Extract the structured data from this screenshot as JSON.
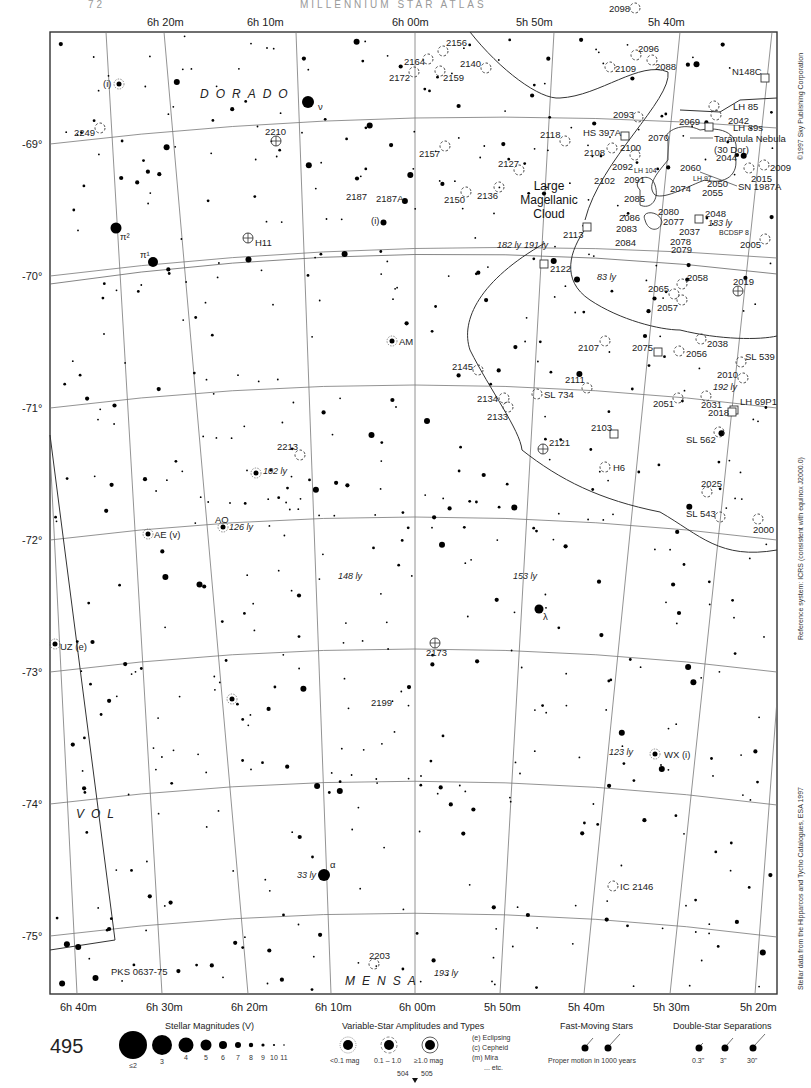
{
  "page": {
    "header_left": "72",
    "header_center": "MILLENNIUM STAR ATLAS",
    "page_number": "495",
    "adjacent_pages": {
      "left": "504",
      "right": "505"
    }
  },
  "side_text": {
    "copyright": "©1997 Sky Publishing Corporation",
    "reference": "Reference system: ICRS (consistent with equinox J2000.0)",
    "source": "Stellar data from the Hipparcos and Tycho Catalogues, ESA 1997"
  },
  "axes": {
    "ra_top": [
      "6h 20m",
      "6h 10m",
      "6h 00m",
      "5h 50m",
      "5h 40m"
    ],
    "ra_bottom": [
      "6h 40m",
      "6h 30m",
      "6h 20m",
      "6h 10m",
      "6h 00m",
      "5h 50m",
      "5h 40m",
      "5h 30m",
      "5h 20m"
    ],
    "dec_left": [
      "-69°",
      "-70°",
      "-71°",
      "-72°",
      "-73°",
      "-74°",
      "-75°"
    ]
  },
  "constellations": [
    {
      "name": "DORADO",
      "x": 200,
      "y": 98
    },
    {
      "name": "VOL",
      "x": 76,
      "y": 818
    },
    {
      "name": "MENSA",
      "x": 345,
      "y": 985
    }
  ],
  "major_labels": {
    "lmc": [
      "Large",
      "Magellanic",
      "Cloud"
    ],
    "tarantula": [
      "Tarántula Nebula",
      "(30 Dor)"
    ],
    "sn": "SN 1987A"
  },
  "named_stars": [
    {
      "label": "ν",
      "x": 308,
      "y": 102,
      "r": 6,
      "lx": 318,
      "ly": 110
    },
    {
      "label": "π²",
      "x": 116,
      "y": 228,
      "r": 5.5,
      "lx": 120,
      "ly": 240
    },
    {
      "label": "π¹",
      "x": 153,
      "y": 262,
      "r": 5,
      "lx": 140,
      "ly": 258
    },
    {
      "label": "α",
      "x": 324,
      "y": 875,
      "r": 6,
      "lx": 330,
      "ly": 868
    },
    {
      "label": "λ",
      "x": 539,
      "y": 609,
      "r": 4.5,
      "lx": 543,
      "ly": 620
    }
  ],
  "variable_stars": [
    {
      "label": "(i)",
      "x": 119,
      "y": 84,
      "lx": 103,
      "ly": 87
    },
    {
      "label": "AM",
      "x": 392,
      "y": 341,
      "lx": 399,
      "ly": 345
    },
    {
      "label": "AE (v)",
      "x": 148,
      "y": 534,
      "lx": 154,
      "ly": 538
    },
    {
      "label": "AO",
      "x": 223,
      "y": 527,
      "lx": 215,
      "ly": 523
    },
    {
      "label": "UZ (e)",
      "x": 55,
      "y": 644,
      "lx": 60,
      "ly": 650
    },
    {
      "label": "WX (i)",
      "x": 655,
      "y": 754,
      "lx": 664,
      "ly": 758
    },
    {
      "label": "",
      "x": 232,
      "y": 699,
      "lx": 0,
      "ly": 0
    },
    {
      "label": "",
      "x": 256,
      "y": 473,
      "lx": 0,
      "ly": 0
    }
  ],
  "distance_labels": [
    {
      "text": "182 ly",
      "x": 497,
      "y": 248
    },
    {
      "text": "191 ly",
      "x": 524,
      "y": 248
    },
    {
      "text": "83 ly",
      "x": 597,
      "y": 280
    },
    {
      "text": "102 ly",
      "x": 263,
      "y": 474
    },
    {
      "text": "126 ly",
      "x": 229,
      "y": 530
    },
    {
      "text": "148 ly",
      "x": 338,
      "y": 579
    },
    {
      "text": "153 ly",
      "x": 513,
      "y": 579
    },
    {
      "text": "192 ly",
      "x": 713,
      "y": 390
    },
    {
      "text": "183 ly",
      "x": 708,
      "y": 226
    },
    {
      "text": "123 ly",
      "x": 609,
      "y": 755
    },
    {
      "text": "33 ly",
      "x": 297,
      "y": 878
    },
    {
      "text": "193 ly",
      "x": 434,
      "y": 976
    }
  ],
  "clusters": [
    {
      "id": "2249",
      "x": 100,
      "y": 128,
      "lx": 74,
      "ly": 136
    },
    {
      "id": "2156",
      "x": 443,
      "y": 51,
      "lx": 446,
      "ly": 46
    },
    {
      "id": "2164",
      "x": 428,
      "y": 59,
      "lx": 404,
      "ly": 65
    },
    {
      "id": "2172",
      "x": 414,
      "y": 72,
      "lx": 389,
      "ly": 81
    },
    {
      "id": "2159",
      "x": 440,
      "y": 71,
      "lx": 443,
      "ly": 81
    },
    {
      "id": "2140",
      "x": 486,
      "y": 68,
      "lx": 460,
      "ly": 67
    },
    {
      "id": "2157",
      "x": 445,
      "y": 146,
      "lx": 419,
      "ly": 157
    },
    {
      "id": "2127",
      "x": 519,
      "y": 170,
      "lx": 498,
      "ly": 167
    },
    {
      "id": "2136",
      "x": 499,
      "y": 187,
      "lx": 477,
      "ly": 199
    },
    {
      "id": "2118",
      "x": 565,
      "y": 141,
      "lx": 540,
      "ly": 138
    },
    {
      "id": "2098",
      "x": 635,
      "y": 8,
      "lx": 609,
      "ly": 12
    },
    {
      "id": "2096",
      "x": 636,
      "y": 55,
      "lx": 638,
      "ly": 52
    },
    {
      "id": "2088",
      "x": 652,
      "y": 60,
      "lx": 655,
      "ly": 70
    },
    {
      "id": "2109",
      "x": 610,
      "y": 67,
      "lx": 615,
      "ly": 72
    },
    {
      "id": "2093",
      "x": 638,
      "y": 117,
      "lx": 613,
      "ly": 118
    },
    {
      "id": "2042",
      "x": 716,
      "y": 115,
      "lx": 728,
      "ly": 124
    },
    {
      "id": "LH 85",
      "x": 714,
      "y": 106,
      "lx": 733,
      "ly": 110
    },
    {
      "id": "2009",
      "x": 764,
      "y": 165,
      "lx": 770,
      "ly": 171
    },
    {
      "id": "2015",
      "x": 749,
      "y": 168,
      "lx": 751,
      "ly": 182
    },
    {
      "id": "2100",
      "x": 635,
      "y": 155,
      "lx": 620,
      "ly": 151
    },
    {
      "id": "2108",
      "x": 612,
      "y": 148,
      "lx": 584,
      "ly": 156
    },
    {
      "id": "2005",
      "x": 765,
      "y": 239,
      "lx": 740,
      "ly": 248
    },
    {
      "id": "2058",
      "x": 682,
      "y": 284,
      "lx": 687,
      "ly": 281
    },
    {
      "id": "2065",
      "x": 674,
      "y": 294,
      "lx": 648,
      "ly": 292
    },
    {
      "id": "2057",
      "x": 682,
      "y": 300,
      "lx": 657,
      "ly": 311
    },
    {
      "id": "2038",
      "x": 701,
      "y": 339,
      "lx": 707,
      "ly": 347
    },
    {
      "id": "2056",
      "x": 679,
      "y": 351,
      "lx": 686,
      "ly": 357
    },
    {
      "id": "SL 539",
      "x": 741,
      "y": 362,
      "lx": 745,
      "ly": 360
    },
    {
      "id": "2010",
      "x": 743,
      "y": 378,
      "lx": 717,
      "ly": 378
    },
    {
      "id": "2051",
      "x": 678,
      "y": 398,
      "lx": 653,
      "ly": 407
    },
    {
      "id": "2031",
      "x": 706,
      "y": 396,
      "lx": 701,
      "ly": 408
    },
    {
      "id": "2107",
      "x": 605,
      "y": 341,
      "lx": 578,
      "ly": 351
    },
    {
      "id": "2111",
      "x": 587,
      "y": 388,
      "lx": 565,
      "ly": 383
    },
    {
      "id": "SL 734",
      "x": 537,
      "y": 394,
      "lx": 544,
      "ly": 398
    },
    {
      "id": "2145",
      "x": 478,
      "y": 370,
      "lx": 452,
      "ly": 370
    },
    {
      "id": "2134",
      "x": 504,
      "y": 398,
      "lx": 477,
      "ly": 402
    },
    {
      "id": "2133",
      "x": 508,
      "y": 407,
      "lx": 487,
      "ly": 420
    },
    {
      "id": "H6",
      "x": 605,
      "y": 467,
      "lx": 613,
      "ly": 471
    },
    {
      "id": "SL 562",
      "x": 719,
      "y": 432,
      "lx": 686,
      "ly": 443
    },
    {
      "id": "2025",
      "x": 707,
      "y": 492,
      "lx": 701,
      "ly": 487
    },
    {
      "id": "SL 543",
      "x": 720,
      "y": 517,
      "lx": 686,
      "ly": 517
    },
    {
      "id": "2000",
      "x": 758,
      "y": 519,
      "lx": 753,
      "ly": 533
    },
    {
      "id": "2213",
      "x": 300,
      "y": 455,
      "lx": 277,
      "ly": 450
    },
    {
      "id": "2203",
      "x": 374,
      "y": 964,
      "lx": 369,
      "ly": 959
    },
    {
      "id": "IC 2146",
      "x": 613,
      "y": 886,
      "lx": 620,
      "ly": 890
    },
    {
      "id": "2150",
      "x": 466,
      "y": 192,
      "lx": 444,
      "ly": 203
    }
  ],
  "globulars": [
    {
      "id": "2210",
      "x": 276,
      "y": 141,
      "lx": 265,
      "ly": 135
    },
    {
      "id": "H11",
      "x": 248,
      "y": 238,
      "lx": 255,
      "ly": 246
    },
    {
      "id": "2019",
      "x": 738,
      "y": 291,
      "lx": 733,
      "ly": 285
    },
    {
      "id": "2121",
      "x": 543,
      "y": 449,
      "lx": 549,
      "ly": 446
    },
    {
      "id": "2173",
      "x": 435,
      "y": 643,
      "lx": 426,
      "ly": 656
    }
  ],
  "nebulae_boxes": [
    {
      "id": "N148C",
      "x": 765,
      "y": 78,
      "lx": 732,
      "ly": 75
    },
    {
      "id": "LH 89s",
      "x": 709,
      "y": 127,
      "lx": 733,
      "ly": 131
    },
    {
      "id": "HS 397A",
      "x": 625,
      "y": 136,
      "lx": 583,
      "ly": 136
    },
    {
      "id": "2113",
      "x": 587,
      "y": 227,
      "lx": 563,
      "ly": 238
    },
    {
      "id": "2122",
      "x": 544,
      "y": 264,
      "lx": 550,
      "ly": 272
    },
    {
      "id": "2048",
      "x": 699,
      "y": 219,
      "lx": 705,
      "ly": 217
    },
    {
      "id": "2075",
      "x": 658,
      "y": 352,
      "lx": 632,
      "ly": 351
    },
    {
      "id": "2103",
      "x": 614,
      "y": 434,
      "lx": 591,
      "ly": 431
    },
    {
      "id": "LH 69P1",
      "x": 734,
      "y": 410,
      "lx": 740,
      "ly": 405
    },
    {
      "id": "2018",
      "x": 732,
      "y": 412,
      "lx": 708,
      "ly": 416
    }
  ],
  "lmc_labels": [
    {
      "text": "2070",
      "x": 648,
      "y": 141
    },
    {
      "text": "2069",
      "x": 679,
      "y": 125
    },
    {
      "text": "2044",
      "x": 716,
      "y": 161
    },
    {
      "text": "2092",
      "x": 612,
      "y": 170
    },
    {
      "text": "2102",
      "x": 594,
      "y": 184
    },
    {
      "text": "2091",
      "x": 624,
      "y": 183
    },
    {
      "text": "2060",
      "x": 680,
      "y": 171
    },
    {
      "text": "2050",
      "x": 707,
      "y": 187
    },
    {
      "text": "2074",
      "x": 670,
      "y": 192
    },
    {
      "text": "2055",
      "x": 702,
      "y": 196
    },
    {
      "text": "2085",
      "x": 624,
      "y": 202
    },
    {
      "text": "2080",
      "x": 658,
      "y": 215
    },
    {
      "text": "2086",
      "x": 619,
      "y": 221
    },
    {
      "text": "2077",
      "x": 663,
      "y": 225
    },
    {
      "text": "2083",
      "x": 616,
      "y": 232
    },
    {
      "text": "2037",
      "x": 679,
      "y": 235
    },
    {
      "text": "2084",
      "x": 615,
      "y": 246
    },
    {
      "text": "2078",
      "x": 670,
      "y": 245
    },
    {
      "text": "2079",
      "x": 671,
      "y": 253
    }
  ],
  "lmc_small_labels": [
    {
      "text": "LH 104",
      "x": 634,
      "y": 173
    },
    {
      "text": "LH 97",
      "x": 693,
      "y": 181
    },
    {
      "text": "BCDSP 8",
      "x": 719,
      "y": 235
    }
  ],
  "other_labels": [
    {
      "text": "2187",
      "x": 346,
      "y": 200
    },
    {
      "text": "2187A",
      "x": 376,
      "y": 202
    },
    {
      "text": "(i)",
      "x": 371,
      "y": 224
    },
    {
      "text": "2199",
      "x": 371,
      "y": 706
    },
    {
      "text": "PKS 0637-75",
      "x": 111,
      "y": 975
    }
  ],
  "legend": {
    "magnitudes": {
      "title": "Stellar Magnitudes (V)",
      "items": [
        {
          "label": "≤2",
          "r": 14
        },
        {
          "label": "3",
          "r": 10
        },
        {
          "label": "4",
          "r": 7.5
        },
        {
          "label": "5",
          "r": 5.5
        },
        {
          "label": "6",
          "r": 4
        },
        {
          "label": "7",
          "r": 3
        },
        {
          "label": "8",
          "r": 2.2
        },
        {
          "label": "9",
          "r": 1.6
        },
        {
          "label": "10",
          "r": 1.1
        },
        {
          "label": "11",
          "r": 0.8
        }
      ]
    },
    "variables": {
      "title": "Variable-Star Amplitudes and Types",
      "amplitudes": [
        "<0.1 mag",
        "0.1 – 1.0",
        "≥1.0 mag"
      ],
      "types": [
        "(e)  Eclipsing",
        "(c)  Cepheid",
        "(m)  Mira",
        "... etc."
      ]
    },
    "fast_moving": {
      "title": "Fast-Moving Stars",
      "caption": "Proper motion in 1000 years"
    },
    "doubles": {
      "title": "Double-Star Separations",
      "items": [
        "0.3\"",
        "3\"",
        "30\""
      ]
    }
  }
}
